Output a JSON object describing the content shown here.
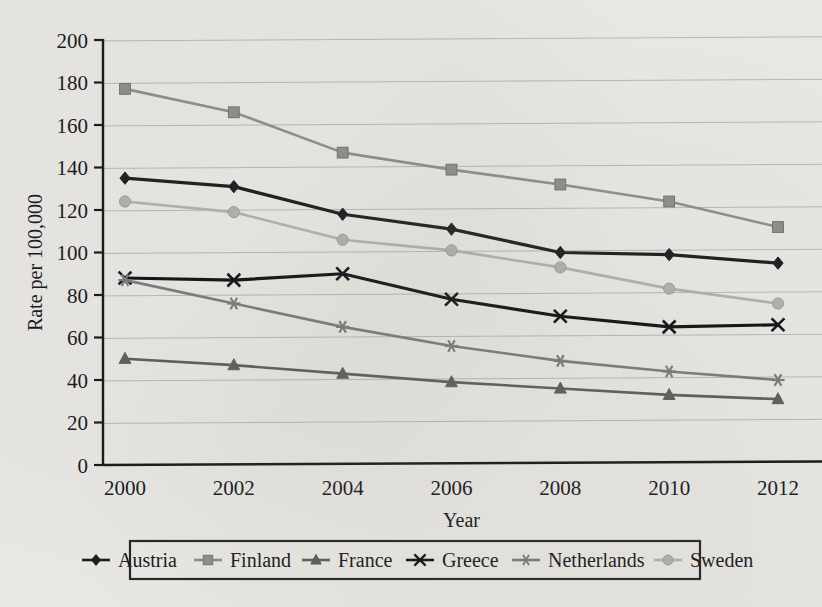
{
  "chart_data": {
    "type": "line",
    "title": "",
    "xlabel": "Year",
    "ylabel": "Rate per 100,000",
    "categories": [
      "2000",
      "2002",
      "2004",
      "2006",
      "2008",
      "2010",
      "2012"
    ],
    "x": [
      2000,
      2002,
      2004,
      2006,
      2008,
      2010,
      2012
    ],
    "xlim": [
      1999,
      2013
    ],
    "ylim": [
      0,
      200
    ],
    "ytick_labels": [
      "0",
      "20",
      "40",
      "60",
      "80",
      "100",
      "120",
      "140",
      "160",
      "180",
      "200"
    ],
    "yticks": [
      0,
      20,
      40,
      60,
      80,
      100,
      120,
      140,
      160,
      180,
      200
    ],
    "grid": "horizontal",
    "legend_position": "below",
    "series": [
      {
        "name": "Austria",
        "marker": "diamond",
        "color": "#1b1b20",
        "values": [
          135,
          131,
          118,
          111,
          100,
          99,
          95
        ]
      },
      {
        "name": "Finland",
        "marker": "square",
        "color": "#8d8d8d",
        "values": [
          177,
          166,
          147,
          139,
          132,
          124,
          112
        ]
      },
      {
        "name": "France",
        "marker": "triangle",
        "color": "#5b5b5e",
        "values": [
          50,
          47,
          43,
          39,
          36,
          33,
          31
        ]
      },
      {
        "name": "Greece",
        "marker": "x",
        "color": "#0f0f13",
        "values": [
          88,
          87,
          90,
          78,
          70,
          65,
          66
        ]
      },
      {
        "name": "Netherlands",
        "marker": "asterisk",
        "color": "#7a7a7d",
        "values": [
          87,
          76,
          65,
          56,
          49,
          44,
          40
        ]
      },
      {
        "name": "Sweden",
        "marker": "circle",
        "color": "#b0b0b0",
        "values": [
          124,
          119,
          106,
          101,
          93,
          83,
          76
        ]
      }
    ]
  },
  "axes": {
    "y_title": "Rate per 100,000",
    "x_title": "Year"
  },
  "legend": {
    "entries": [
      {
        "label": "Austria"
      },
      {
        "label": "Finland"
      },
      {
        "label": "France"
      },
      {
        "label": "Greece"
      },
      {
        "label": "Netherlands"
      },
      {
        "label": "Sweden"
      }
    ]
  }
}
